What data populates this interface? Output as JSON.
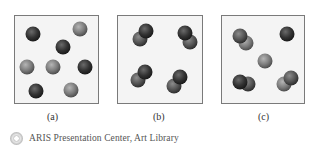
{
  "panels": [
    {
      "label": "(a)",
      "description": "individual atoms of two kinds",
      "particles": [
        {
          "kind": "single",
          "tone": "dark"
        },
        {
          "kind": "single",
          "tone": "light"
        },
        {
          "kind": "single",
          "tone": "dark"
        },
        {
          "kind": "single",
          "tone": "light"
        },
        {
          "kind": "single",
          "tone": "light"
        },
        {
          "kind": "single",
          "tone": "dark"
        },
        {
          "kind": "single",
          "tone": "dark"
        },
        {
          "kind": "single",
          "tone": "light"
        }
      ]
    },
    {
      "label": "(b)",
      "description": "diatomic molecules",
      "particles": [
        {
          "kind": "diatomic",
          "tone": "dark"
        },
        {
          "kind": "diatomic",
          "tone": "dark"
        },
        {
          "kind": "diatomic",
          "tone": "dark"
        },
        {
          "kind": "diatomic",
          "tone": "dark"
        }
      ]
    },
    {
      "label": "(c)",
      "description": "mixture of diatomic molecules and single atoms",
      "particles": [
        {
          "kind": "diatomic",
          "tone": "light"
        },
        {
          "kind": "single",
          "tone": "dark"
        },
        {
          "kind": "single",
          "tone": "light"
        },
        {
          "kind": "diatomic",
          "tone": "dark"
        },
        {
          "kind": "diatomic",
          "tone": "light"
        }
      ]
    }
  ],
  "credit": {
    "icon": "cd-disc-icon",
    "text": "ARIS Presentation Center, Art Library"
  },
  "colors": {
    "box_border": "#7a7a7a",
    "box_fill": "#f3f3f3",
    "dark_atom": "#3a3a3a",
    "light_atom": "#8a8a8a"
  }
}
